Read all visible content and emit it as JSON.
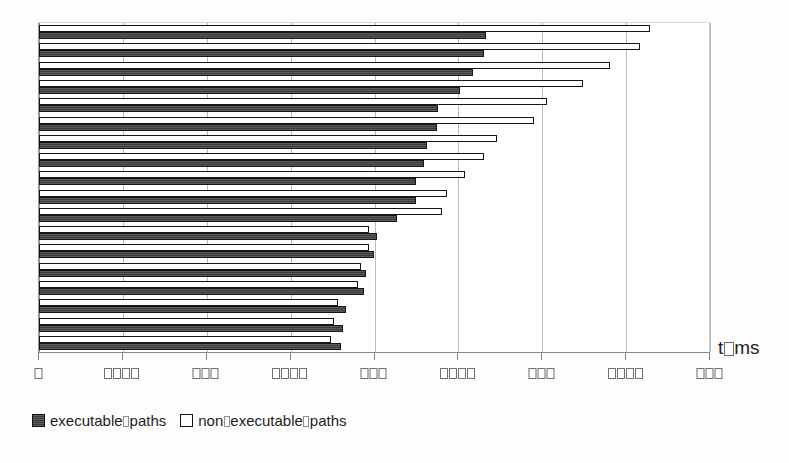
{
  "chart_data": {
    "type": "bar",
    "orientation": "horizontal",
    "title": "",
    "subtitle": "",
    "xlabel": "t/ms",
    "xlabel_rendered": "t□ms",
    "ylabel": "",
    "grid": true,
    "grid_axis": "x",
    "legend_position": "bottom-left",
    "xlim": [
      0,
      8000
    ],
    "xticks": [
      0,
      1000,
      2000,
      3000,
      4000,
      5000,
      6000,
      7000,
      8000
    ],
    "xtick_labels": [
      "0",
      "1000",
      "2000",
      "3000",
      "4000",
      "5000",
      "6000",
      "7000",
      "8000"
    ],
    "xtick_labels_rendered": [
      "□",
      "□□□□",
      "□□□",
      "□□□□",
      "□□□",
      "□□□□",
      "□□□",
      "□□□□",
      "□□□"
    ],
    "categories": [
      "1",
      "2",
      "3",
      "4",
      "5",
      "6",
      "7",
      "8",
      "9",
      "10",
      "11",
      "12",
      "13",
      "14",
      "15",
      "16",
      "17",
      "18"
    ],
    "series": [
      {
        "name": "executable paths",
        "name_rendered": "executable□paths",
        "color": "#3b3b3b",
        "values": [
          5330,
          5300,
          5170,
          5020,
          4760,
          4750,
          4620,
          4590,
          4500,
          4500,
          4270,
          4030,
          3990,
          3900,
          3880,
          3660,
          3630,
          3600
        ]
      },
      {
        "name": "non-executable paths",
        "name_rendered": "non□executable□paths",
        "color": "#ffffff",
        "values": [
          7290,
          7160,
          6810,
          6480,
          6060,
          5900,
          5460,
          5300,
          5080,
          4860,
          4810,
          3940,
          3930,
          3840,
          3800,
          3560,
          3520,
          3480
        ]
      }
    ]
  },
  "legend": {
    "entries": [
      {
        "label": "executable paths",
        "label_rendered": "executable□paths",
        "swatch": "dark-filled-square"
      },
      {
        "label": "non-executable paths",
        "label_rendered": "non□executable□paths",
        "swatch": "white-outlined-square"
      }
    ]
  },
  "axis": {
    "title": "t/ms",
    "title_rendered": "t□ms"
  },
  "colors": {
    "executable_bar": "#3b3b3b",
    "nonexecutable_bar": "#ffffff",
    "bar_outline": "#151515",
    "gridline": "#b9b9b9",
    "axis_line": "#8a8a8a",
    "background": "#ffffff"
  }
}
